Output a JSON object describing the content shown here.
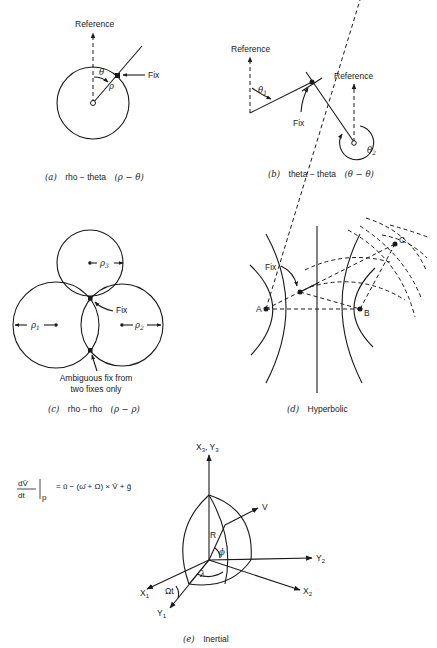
{
  "panels": {
    "a": {
      "caption_letter": "(a)",
      "caption_text": "rho − theta",
      "caption_symbols": "(ρ − θ)",
      "labels": {
        "reference": "Reference",
        "fix": "Fix",
        "theta": "θ",
        "rho": "ρ"
      }
    },
    "b": {
      "caption_letter": "(b)",
      "caption_text": "theta − theta",
      "caption_symbols": "(θ − θ)",
      "labels": {
        "reference_left": "Reference",
        "reference_right": "Reference",
        "fix": "Fix",
        "theta1": "θ",
        "theta1_sub": "1",
        "theta2": "θ",
        "theta2_sub": "2"
      }
    },
    "c": {
      "caption_letter": "(c)",
      "caption_text": "rho − rho",
      "caption_symbols": "(ρ − ρ)",
      "labels": {
        "rho1": "ρ",
        "rho1_sub": "1",
        "rho2": "ρ",
        "rho2_sub": "2",
        "rho3": "ρ",
        "rho3_sub": "3",
        "fix": "Fix",
        "ambiguous_line1": "Ambiguous fix from",
        "ambiguous_line2": "two fixes only"
      }
    },
    "d": {
      "caption_letter": "(d)",
      "caption_text": "Hyperbolic",
      "labels": {
        "fix": "Fix",
        "a": "A",
        "b": "B",
        "c": "C"
      }
    },
    "e": {
      "caption_letter": "(e)",
      "caption_text": "Inertial",
      "equation": {
        "numerator": "dV̄",
        "denominator": "dt",
        "subscript": "p",
        "rhs": "= ū − (ω̄ + Ω) × V̄ + ḡ"
      },
      "labels": {
        "x3y3": "X",
        "x3y3_sub1": "3",
        "x3y3_mid": ", Y",
        "x3y3_sub2": "3",
        "v": "V",
        "r": "R",
        "phi": "ϕ",
        "lambda": "λ",
        "y2": "Y",
        "y2_sub": "2",
        "x2": "X",
        "x2_sub": "2",
        "x1": "X",
        "x1_sub": "1",
        "y1": "Y",
        "y1_sub": "1",
        "omega_t": "Ωt"
      }
    }
  }
}
